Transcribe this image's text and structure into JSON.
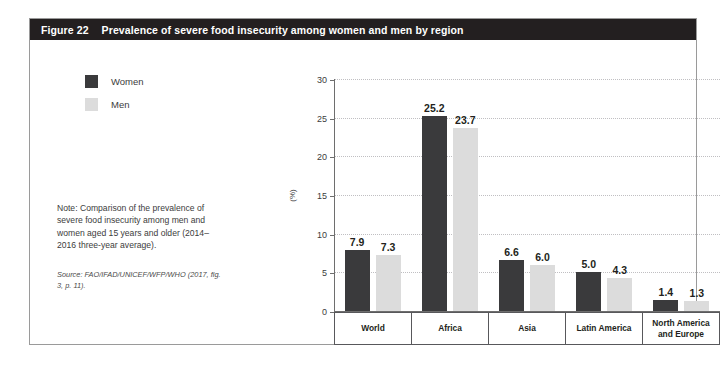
{
  "figure": {
    "number": "Figure 22",
    "title": "Prevalence of severe food insecurity among women and men by region"
  },
  "legend": {
    "items": [
      {
        "label": "Women",
        "color": "#3a3a3c"
      },
      {
        "label": "Men",
        "color": "#dcdcdc"
      }
    ]
  },
  "note": "Note: Comparison of the prevalence of severe food insecurity among men and women aged 15 years and older (2014–2016 three-year average).",
  "source": "Source: FAO/IFAD/UNICEF/WFP/WHO (2017, fig. 3, p. 11).",
  "chart_data": {
    "type": "bar",
    "title": "Prevalence of severe food insecurity among women and men by region",
    "xlabel": "",
    "ylabel": "(%)",
    "ylim": [
      0,
      30
    ],
    "yticks": [
      0,
      5,
      10,
      15,
      20,
      25,
      30
    ],
    "ytick_labels": [
      "0",
      "5",
      "10",
      "15",
      "20",
      "25",
      "30"
    ],
    "grid": "horizontal-dotted",
    "legend_position": "upper-left-outside",
    "categories": [
      "World",
      "Africa",
      "Asia",
      "Latin America",
      "North America and Europe"
    ],
    "series": [
      {
        "name": "Women",
        "color": "#3a3a3c",
        "values": [
          7.9,
          6.6,
          5.0,
          1.4,
          25.2
        ],
        "labels": [
          "7.9",
          "25.2",
          "6.6",
          "5.0",
          "1.4"
        ]
      },
      {
        "name": "Men",
        "color": "#dcdcdc",
        "values": [
          7.3,
          23.7,
          6.0,
          4.3,
          1.3
        ],
        "labels": [
          "7.3",
          "23.7",
          "6.0",
          "4.3",
          "1.3"
        ]
      }
    ],
    "groups": [
      {
        "category": "World",
        "women": 7.9,
        "men": 7.3,
        "women_label": "7.9",
        "men_label": "7.3"
      },
      {
        "category": "Africa",
        "women": 25.2,
        "men": 23.7,
        "women_label": "25.2",
        "men_label": "23.7"
      },
      {
        "category": "Asia",
        "women": 6.6,
        "men": 6.0,
        "women_label": "6.6",
        "men_label": "6.0"
      },
      {
        "category": "Latin America",
        "women": 5.0,
        "men": 4.3,
        "women_label": "5.0",
        "men_label": "4.3"
      },
      {
        "category": "North America and Europe",
        "women": 1.4,
        "men": 1.3,
        "women_label": "1.4",
        "men_label": "1.3"
      }
    ]
  }
}
